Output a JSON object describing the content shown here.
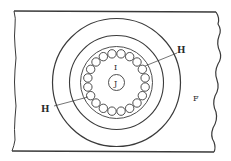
{
  "figure": {
    "type": "technical-drawing",
    "colors": {
      "stroke": "#3a3a3a",
      "background": "#ffffff"
    },
    "plate": {
      "label": "F",
      "top_edge_y": 11,
      "bottom_edge_y": 152,
      "left_edge_x": 14,
      "right_edge_x": 218
    },
    "center": {
      "x": 116.5,
      "y": 82.5
    },
    "circles": {
      "outer_radius": 64,
      "middle_radius": 47,
      "race_radius": 36,
      "hub_radius": 8
    },
    "balls": {
      "count": 20,
      "orbit_radius": 29,
      "ball_radius": 4.2
    },
    "labels": {
      "ball_label_right": "H",
      "ball_label_left": "H",
      "inner_region": "I",
      "hub": "J",
      "plate": "F"
    }
  }
}
